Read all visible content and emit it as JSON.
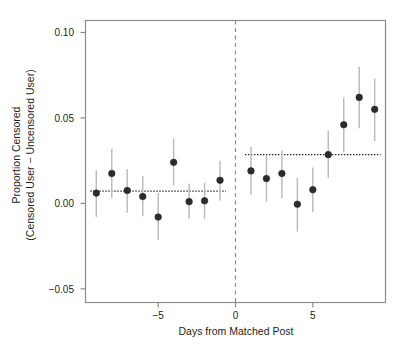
{
  "chart_data": {
    "type": "scatter",
    "title": "",
    "xlabel": "Days from Matched Post",
    "ylabel_line1": "Proportion Censored",
    "ylabel_line2": "(Censored User − Uncensored User)",
    "xlim": [
      -9.7,
      9.7
    ],
    "ylim": [
      -0.058,
      0.107
    ],
    "xticks": [
      -5,
      0,
      5
    ],
    "xtick_labels": [
      "−5",
      "0",
      "5"
    ],
    "yticks": [
      -0.05,
      0.0,
      0.05,
      0.1
    ],
    "ytick_labels": [
      "−0.05",
      "0.00",
      "0.05",
      "0.10"
    ],
    "grid": false,
    "legend": "none",
    "point_color": "#2b2b2b",
    "errorbar_color": "#bdbdbd",
    "reference_line_color": "#222222",
    "axis_color": "#8c8c8c",
    "x": [
      -9,
      -8,
      -7,
      -6,
      -5,
      -4,
      -3,
      -2,
      -1,
      1,
      2,
      3,
      4,
      5,
      6,
      7,
      8,
      9
    ],
    "values": [
      0.006,
      0.0175,
      0.0075,
      0.004,
      -0.008,
      0.024,
      0.001,
      0.0015,
      0.0135,
      0.019,
      0.0145,
      0.0175,
      -0.0005,
      0.008,
      0.0285,
      0.046,
      0.062,
      0.055
    ],
    "err_low": [
      -0.008,
      0.003,
      -0.0055,
      -0.0075,
      -0.0215,
      0.0105,
      -0.009,
      -0.009,
      0.0015,
      0.005,
      0.001,
      0.003,
      -0.0165,
      -0.005,
      0.015,
      0.03,
      0.044,
      0.0365
    ],
    "err_high": [
      0.0195,
      0.032,
      0.02,
      0.016,
      0.006,
      0.038,
      0.0115,
      0.012,
      0.025,
      0.033,
      0.028,
      0.031,
      0.015,
      0.021,
      0.0425,
      0.062,
      0.08,
      0.073
    ],
    "vline_x": 0,
    "reference_segments": [
      {
        "name": "pre-period-mean",
        "x_start": -9,
        "x_end": -1,
        "y": 0.0072
      },
      {
        "name": "post-period-mean",
        "x_start": 1,
        "x_end": 9,
        "y": 0.0285
      }
    ]
  },
  "caption": {
    "text": ""
  }
}
